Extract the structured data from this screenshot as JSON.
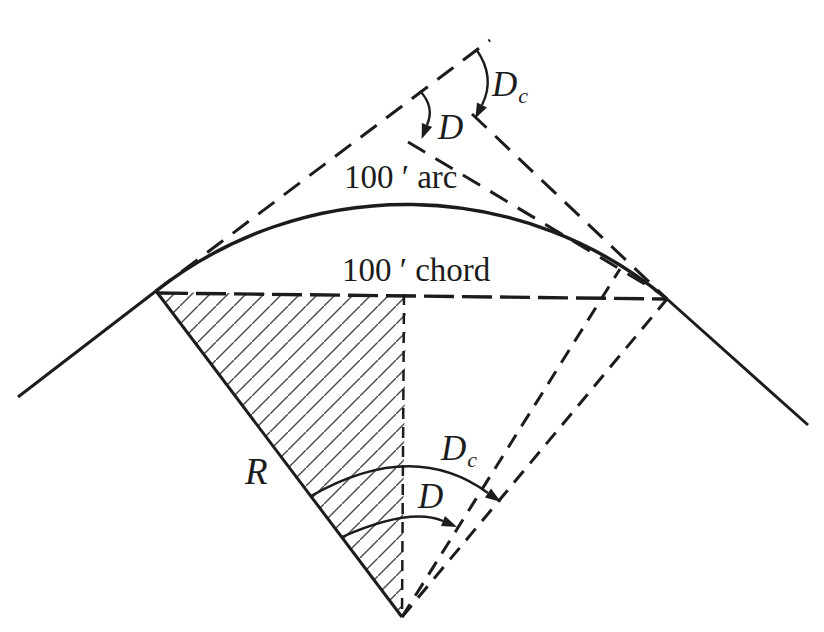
{
  "figure": {
    "background": "#ffffff",
    "ink_color": "#1c1c1c",
    "hatch_color": "#4a4a4a",
    "labels": {
      "arc_length": "100 ′ arc",
      "chord_length": "100 ′ chord",
      "radius": "R",
      "degree_arc_top": "D",
      "degree_chord_top": {
        "main": "D",
        "sub": "c"
      },
      "degree_arc_bottom": "D",
      "degree_chord_bottom": {
        "main": "D",
        "sub": "c"
      }
    }
  }
}
